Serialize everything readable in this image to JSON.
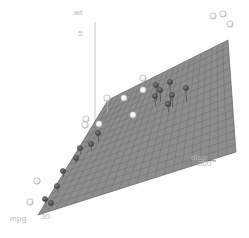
{
  "figure": {
    "title": "",
    "background_color": "#fefefe",
    "width": 249,
    "height": 238
  },
  "axes": {
    "x": {
      "name": "mpg",
      "label": "mpg",
      "tick_label": "30",
      "tick_value": 30,
      "color": "#b8b8b8"
    },
    "y": {
      "name": "disp",
      "label": "disp",
      "tick_label": "300",
      "tick_value": 300,
      "color": "#b8b8b8"
    },
    "z": {
      "name": "wt",
      "label": "wt",
      "tick_label": "5",
      "tick_value": 5,
      "color": "#b8b8b8"
    }
  },
  "surface": {
    "name": "regression-plane",
    "fill_color": "#8d8d8d",
    "grid_color": "#6e6e6e",
    "grid_cols": 22,
    "grid_rows": 16,
    "corners": [
      {
        "x": 38,
        "y": 215
      },
      {
        "x": 108,
        "y": 100
      },
      {
        "x": 228,
        "y": 40
      },
      {
        "x": 236,
        "y": 152
      }
    ]
  },
  "chart_data": {
    "type": "scatter",
    "title": "",
    "xlabel": "mpg",
    "ylabel": "disp",
    "zlabel": "wt",
    "xlim": [
      10,
      34
    ],
    "ylim": [
      70,
      480
    ],
    "zlim": [
      1.5,
      5.5
    ],
    "xticks": [
      30
    ],
    "yticks": [
      300
    ],
    "zticks": [
      5
    ],
    "grid": true,
    "legend": "none",
    "surface": {
      "name": "fitted regression plane",
      "kind": "plane"
    },
    "points": [
      {
        "px": 213,
        "py": 16,
        "r": 3.2,
        "fill": "white",
        "side": "above",
        "drop": 0
      },
      {
        "px": 223,
        "py": 14,
        "r": 3.2,
        "fill": "white",
        "side": "above",
        "drop": 0
      },
      {
        "px": 230,
        "py": 24,
        "r": 3.2,
        "fill": "white",
        "side": "above",
        "drop": 0
      },
      {
        "px": 143,
        "py": 78,
        "r": 3.2,
        "fill": "white",
        "side": "above",
        "drop": 0
      },
      {
        "px": 143,
        "py": 90,
        "r": 3.2,
        "fill": "white",
        "side": "above",
        "drop": 0
      },
      {
        "px": 124,
        "py": 98,
        "r": 3.2,
        "fill": "white",
        "side": "above",
        "drop": 0
      },
      {
        "px": 107,
        "py": 98,
        "r": 3.2,
        "fill": "white",
        "side": "above",
        "drop": 14
      },
      {
        "px": 133,
        "py": 115,
        "r": 3.2,
        "fill": "white",
        "side": "above",
        "drop": 0
      },
      {
        "px": 99,
        "py": 124,
        "r": 3.2,
        "fill": "white",
        "side": "above",
        "drop": 0
      },
      {
        "px": 86,
        "py": 119,
        "r": 3.2,
        "fill": "white",
        "side": "above",
        "drop": 0
      },
      {
        "px": 85,
        "py": 125,
        "r": 3.2,
        "fill": "white",
        "side": "above",
        "drop": 0
      },
      {
        "px": 37,
        "py": 181,
        "r": 3.2,
        "fill": "white",
        "side": "above",
        "drop": 0
      },
      {
        "px": 30,
        "py": 202,
        "r": 3.2,
        "fill": "white",
        "side": "above",
        "drop": 0
      },
      {
        "px": 156,
        "py": 85,
        "r": 2.6,
        "fill": "dark",
        "side": "below",
        "drop": 16
      },
      {
        "px": 160,
        "py": 90,
        "r": 2.6,
        "fill": "dark",
        "side": "below",
        "drop": 12
      },
      {
        "px": 155,
        "py": 96,
        "r": 2.6,
        "fill": "dark",
        "side": "below",
        "drop": 10
      },
      {
        "px": 170,
        "py": 82,
        "r": 2.6,
        "fill": "dark",
        "side": "below",
        "drop": 22
      },
      {
        "px": 172,
        "py": 95,
        "r": 2.6,
        "fill": "dark",
        "side": "below",
        "drop": 12
      },
      {
        "px": 168,
        "py": 104,
        "r": 2.6,
        "fill": "dark",
        "side": "below",
        "drop": 8
      },
      {
        "px": 186,
        "py": 88,
        "r": 2.6,
        "fill": "dark",
        "side": "below",
        "drop": 14
      },
      {
        "px": 98,
        "py": 133,
        "r": 2.6,
        "fill": "dark",
        "side": "below",
        "drop": 8
      },
      {
        "px": 91,
        "py": 144,
        "r": 2.6,
        "fill": "dark",
        "side": "below",
        "drop": 7
      },
      {
        "px": 80,
        "py": 148,
        "r": 2.6,
        "fill": "dark",
        "side": "below",
        "drop": 6
      },
      {
        "px": 76,
        "py": 158,
        "r": 2.6,
        "fill": "dark",
        "side": "below",
        "drop": 5
      },
      {
        "px": 63,
        "py": 171,
        "r": 2.6,
        "fill": "dark",
        "side": "below",
        "drop": 6
      },
      {
        "px": 57,
        "py": 186,
        "r": 2.6,
        "fill": "dark",
        "side": "below",
        "drop": 5
      },
      {
        "px": 45,
        "py": 199,
        "r": 2.6,
        "fill": "dark",
        "side": "below",
        "drop": 5
      },
      {
        "px": 51,
        "py": 203,
        "r": 2.6,
        "fill": "dark",
        "side": "below",
        "drop": 4
      }
    ],
    "point_styles": {
      "white": {
        "fill": "#ffffff",
        "stroke": "#9a9a9a"
      },
      "dark": {
        "fill": "#5a5a5a",
        "stroke": "#404040"
      }
    }
  },
  "label_positions": {
    "z_name": {
      "left": 74,
      "top": 8
    },
    "z_tick": {
      "left": 78,
      "top": 29
    },
    "x_name": {
      "left": 10,
      "top": 214
    },
    "x_tick": {
      "left": 41,
      "top": 212
    },
    "y_name": {
      "left": 191,
      "top": 153
    },
    "y_tick": {
      "left": 198,
      "top": 159
    }
  }
}
